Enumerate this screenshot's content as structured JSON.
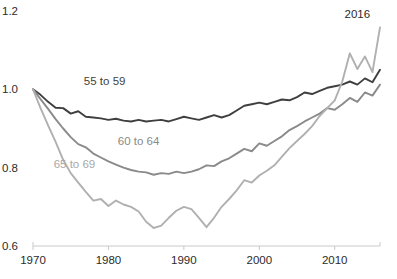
{
  "chart_data": {
    "type": "line",
    "title": "",
    "subtitle": "",
    "xlabel": "",
    "ylabel": "",
    "xlim": [
      1970,
      2016
    ],
    "ylim": [
      0.6,
      1.2
    ],
    "grid": false,
    "legend_position": "inline-labels",
    "x_tick_labels": [
      "1970",
      "1980",
      "1990",
      "2000",
      "2010"
    ],
    "x_ticks": [
      1970,
      1980,
      1990,
      2000,
      2010
    ],
    "y_tick_labels": [
      "1.2",
      "1.0",
      "0.8",
      "0.6"
    ],
    "y_ticks": [
      1.2,
      1.0,
      0.8,
      0.6
    ],
    "annotations": [
      {
        "text": "2016",
        "x": 2013.0,
        "y": 1.182
      }
    ],
    "x": [
      1970,
      1971,
      1972,
      1973,
      1974,
      1975,
      1976,
      1977,
      1978,
      1979,
      1980,
      1981,
      1982,
      1983,
      1984,
      1985,
      1986,
      1987,
      1988,
      1989,
      1990,
      1991,
      1992,
      1993,
      1994,
      1995,
      1996,
      1997,
      1998,
      1999,
      2000,
      2001,
      2002,
      2003,
      2004,
      2005,
      2006,
      2007,
      2008,
      2009,
      2010,
      2011,
      2012,
      2013,
      2014,
      2015,
      2016
    ],
    "series": [
      {
        "name": "55 to 59",
        "color": "#3f3f3f",
        "label_color": "#3f3f3f",
        "label_x": 1979.5,
        "label_y": 1.012,
        "values": [
          1.0,
          0.986,
          0.968,
          0.953,
          0.952,
          0.938,
          0.944,
          0.93,
          0.928,
          0.926,
          0.922,
          0.925,
          0.92,
          0.918,
          0.922,
          0.918,
          0.92,
          0.922,
          0.918,
          0.924,
          0.93,
          0.926,
          0.922,
          0.928,
          0.934,
          0.928,
          0.934,
          0.946,
          0.958,
          0.962,
          0.966,
          0.962,
          0.968,
          0.974,
          0.972,
          0.98,
          0.992,
          0.988,
          0.996,
          1.004,
          1.008,
          1.012,
          1.02,
          1.012,
          1.028,
          1.018,
          1.05
        ]
      },
      {
        "name": "60 to 64",
        "color": "#8a8a8a",
        "label_color": "#8a8a8a",
        "label_x": 1984.0,
        "label_y": 0.858,
        "values": [
          1.0,
          0.975,
          0.95,
          0.924,
          0.9,
          0.878,
          0.86,
          0.852,
          0.836,
          0.826,
          0.816,
          0.808,
          0.8,
          0.794,
          0.79,
          0.788,
          0.782,
          0.786,
          0.784,
          0.79,
          0.786,
          0.79,
          0.796,
          0.806,
          0.804,
          0.816,
          0.824,
          0.836,
          0.848,
          0.842,
          0.862,
          0.856,
          0.868,
          0.88,
          0.896,
          0.906,
          0.918,
          0.928,
          0.938,
          0.952,
          0.948,
          0.962,
          0.978,
          0.968,
          0.992,
          0.984,
          1.012
        ]
      },
      {
        "name": "65 to 69",
        "color": "#b0b0b0",
        "label_color": "#a8a8a8",
        "label_x": 1975.5,
        "label_y": 0.8,
        "values": [
          1.0,
          0.952,
          0.908,
          0.866,
          0.82,
          0.786,
          0.762,
          0.738,
          0.716,
          0.72,
          0.702,
          0.716,
          0.706,
          0.7,
          0.688,
          0.662,
          0.646,
          0.652,
          0.672,
          0.69,
          0.7,
          0.694,
          0.672,
          0.648,
          0.672,
          0.7,
          0.72,
          0.742,
          0.768,
          0.762,
          0.78,
          0.792,
          0.806,
          0.828,
          0.85,
          0.868,
          0.886,
          0.906,
          0.932,
          0.952,
          0.972,
          1.02,
          1.092,
          1.052,
          1.084,
          1.044,
          1.158
        ]
      }
    ]
  }
}
